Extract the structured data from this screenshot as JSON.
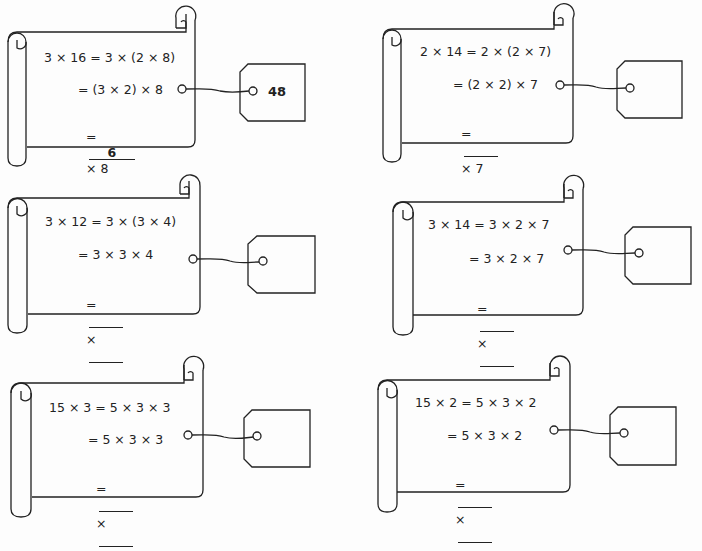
{
  "worksheet": {
    "problems": [
      {
        "id": 1,
        "line1": "3 × 16 = 3 × (2 × 8)",
        "line2": "= (3 × 2) × 8",
        "line3_prefix": "=",
        "blank1": "6",
        "line3_suffix": "× 8",
        "blank2": null,
        "tag_answer": "48"
      },
      {
        "id": 2,
        "line1": "2 × 14 = 2 × (2 × 7)",
        "line2": "= (2 × 2) × 7",
        "line3_prefix": "=",
        "blank1": "",
        "line3_suffix": "× 7",
        "blank2": null,
        "tag_answer": ""
      },
      {
        "id": 3,
        "line1": "3 × 12 = 3 × (3 × 4)",
        "line2": "= 3 × 3 × 4",
        "line3_prefix": "=",
        "blank1": "",
        "line3_suffix": "×",
        "blank2": "",
        "tag_answer": ""
      },
      {
        "id": 4,
        "line1": "3 × 14 = 3 × 2 × 7",
        "line2": "= 3 × 2 × 7",
        "line3_prefix": "=",
        "blank1": "",
        "line3_suffix": "×",
        "blank2": "",
        "tag_answer": ""
      },
      {
        "id": 5,
        "line1": "15 × 3 = 5 × 3 × 3",
        "line2": "= 5 × 3 × 3",
        "line3_prefix": "=",
        "blank1": "",
        "line3_suffix": "×",
        "blank2": "",
        "tag_answer": ""
      },
      {
        "id": 6,
        "line1": "15 × 2 = 5 × 3 × 2",
        "line2": "= 5 × 3 × 2",
        "line3_prefix": "=",
        "blank1": "",
        "line3_suffix": "×",
        "blank2": "",
        "tag_answer": ""
      }
    ]
  },
  "colors": {
    "ink": "#222222",
    "paper": "#fdfdfd"
  }
}
